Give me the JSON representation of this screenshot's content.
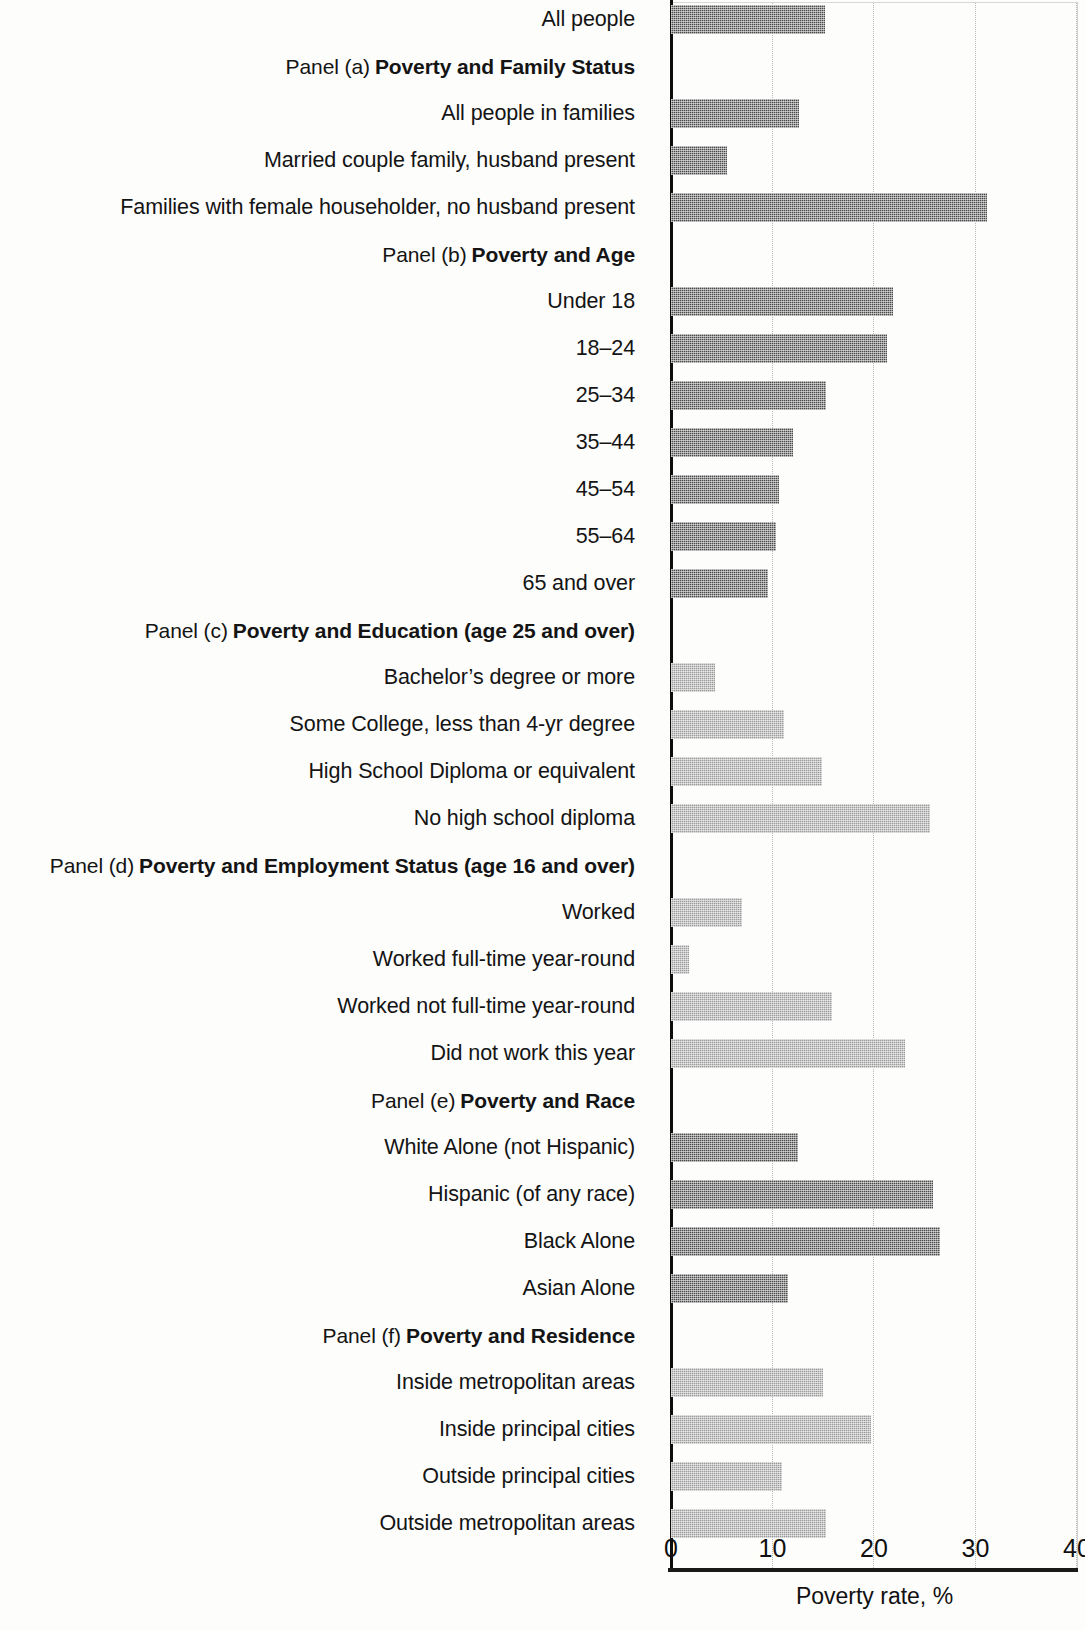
{
  "chart_data": {
    "type": "bar",
    "orientation": "horizontal",
    "title": "",
    "xlabel": "Poverty rate, %",
    "ylabel": "",
    "xlim": [
      0,
      40
    ],
    "xticks": [
      0,
      10,
      20,
      30,
      40
    ],
    "xtick_labels": [
      "0",
      "10",
      "20",
      "30",
      "40"
    ],
    "grid": "vertical-dotted",
    "legend": "none",
    "colors": {
      "dark_bar": "#4a4a4a",
      "light_bar": "#9b9b9b",
      "axis": "#0d0d0d",
      "gridline": "#b9b9b9"
    },
    "categories": [
      "All people",
      "All people in families",
      "Married couple family, husband present",
      "Families with female householder, no husband present",
      "Under 18",
      "18–24",
      "25–34",
      "35–44",
      "45–54",
      "55–64",
      "65 and over",
      "Bachelor’s degree or more",
      "Some College, less than 4-yr degree",
      "High School Diploma or equivalent",
      "No high school diploma",
      "Worked",
      "Worked full-time year-round",
      "Worked not full-time year-round",
      "Did not work this year",
      "White Alone (not Hispanic)",
      "Hispanic (of any race)",
      "Black Alone",
      "Asian Alone",
      "Inside metropolitan areas",
      "Inside principal cities",
      "Outside principal cities",
      "Outside metropolitan areas"
    ],
    "values": [
      15.2,
      12.6,
      5.5,
      31.1,
      21.9,
      21.3,
      15.3,
      12.0,
      10.6,
      10.3,
      9.6,
      4.3,
      11.1,
      14.9,
      25.5,
      7.0,
      1.8,
      15.9,
      23.1,
      12.5,
      25.8,
      26.5,
      11.5,
      15.0,
      19.7,
      10.9,
      15.3
    ],
    "panels": [
      {
        "prefix": "Panel (a)",
        "title": "Poverty and Family Status"
      },
      {
        "prefix": "Panel (b)",
        "title": "Poverty and Age"
      },
      {
        "prefix": "Panel (c)",
        "title": "Poverty and Education (age 25 and over)"
      },
      {
        "prefix": "Panel (d)",
        "title": "Poverty and Employment Status (age 16 and over)"
      },
      {
        "prefix": "Panel (e)",
        "title": "Poverty and Race"
      },
      {
        "prefix": "Panel (f)",
        "title": "Poverty and Residence"
      }
    ]
  },
  "rows": [
    {
      "kind": "bar",
      "label": "All people",
      "value": 15.2,
      "shade": "dark"
    },
    {
      "kind": "panel",
      "prefix": "Panel (a)",
      "title": "Poverty and Family Status"
    },
    {
      "kind": "bar",
      "label": "All people in families",
      "value": 12.6,
      "shade": "dark"
    },
    {
      "kind": "bar",
      "label": "Married couple family, husband present",
      "value": 5.5,
      "shade": "dark"
    },
    {
      "kind": "bar",
      "label": "Families with female householder, no husband present",
      "value": 31.1,
      "shade": "dark"
    },
    {
      "kind": "panel",
      "prefix": "Panel (b)",
      "title": "Poverty and Age"
    },
    {
      "kind": "bar",
      "label": "Under 18",
      "value": 21.9,
      "shade": "dark"
    },
    {
      "kind": "bar",
      "label": "18–24",
      "value": 21.3,
      "shade": "dark"
    },
    {
      "kind": "bar",
      "label": "25–34",
      "value": 15.3,
      "shade": "dark"
    },
    {
      "kind": "bar",
      "label": "35–44",
      "value": 12.0,
      "shade": "dark"
    },
    {
      "kind": "bar",
      "label": "45–54",
      "value": 10.6,
      "shade": "dark"
    },
    {
      "kind": "bar",
      "label": "55–64",
      "value": 10.3,
      "shade": "dark"
    },
    {
      "kind": "bar",
      "label": "65 and over",
      "value": 9.6,
      "shade": "dark"
    },
    {
      "kind": "panel",
      "prefix": "Panel (c)",
      "title": "Poverty and Education (age 25 and over)"
    },
    {
      "kind": "bar",
      "label": "Bachelor’s degree or more",
      "value": 4.3,
      "shade": "light"
    },
    {
      "kind": "bar",
      "label": "Some College, less than 4-yr degree",
      "value": 11.1,
      "shade": "light"
    },
    {
      "kind": "bar",
      "label": "High School Diploma or equivalent",
      "value": 14.9,
      "shade": "light"
    },
    {
      "kind": "bar",
      "label": "No high school diploma",
      "value": 25.5,
      "shade": "light"
    },
    {
      "kind": "panel",
      "prefix": "Panel (d)",
      "title": "Poverty and Employment Status (age 16 and over)"
    },
    {
      "kind": "bar",
      "label": "Worked",
      "value": 7.0,
      "shade": "light"
    },
    {
      "kind": "bar",
      "label": "Worked full-time year-round",
      "value": 1.8,
      "shade": "light"
    },
    {
      "kind": "bar",
      "label": "Worked not full-time year-round",
      "value": 15.9,
      "shade": "light"
    },
    {
      "kind": "bar",
      "label": "Did not work this year",
      "value": 23.1,
      "shade": "light"
    },
    {
      "kind": "panel",
      "prefix": "Panel (e)",
      "title": "Poverty and Race"
    },
    {
      "kind": "bar",
      "label": "White Alone (not Hispanic)",
      "value": 12.5,
      "shade": "dark"
    },
    {
      "kind": "bar",
      "label": "Hispanic (of any race)",
      "value": 25.8,
      "shade": "dark"
    },
    {
      "kind": "bar",
      "label": "Black Alone",
      "value": 26.5,
      "shade": "dark"
    },
    {
      "kind": "bar",
      "label": "Asian Alone",
      "value": 11.5,
      "shade": "dark"
    },
    {
      "kind": "panel",
      "prefix": "Panel (f)",
      "title": "Poverty and Residence"
    },
    {
      "kind": "bar",
      "label": "Inside metropolitan areas",
      "value": 15.0,
      "shade": "light"
    },
    {
      "kind": "bar",
      "label": "Inside principal cities",
      "value": 19.7,
      "shade": "light"
    },
    {
      "kind": "bar",
      "label": "Outside principal cities",
      "value": 10.9,
      "shade": "light"
    },
    {
      "kind": "bar",
      "label": "Outside metropolitan areas",
      "value": 15.3,
      "shade": "light"
    }
  ],
  "axis": {
    "ticks": [
      "0",
      "10",
      "20",
      "30",
      "40"
    ],
    "title": "Poverty rate, %"
  }
}
